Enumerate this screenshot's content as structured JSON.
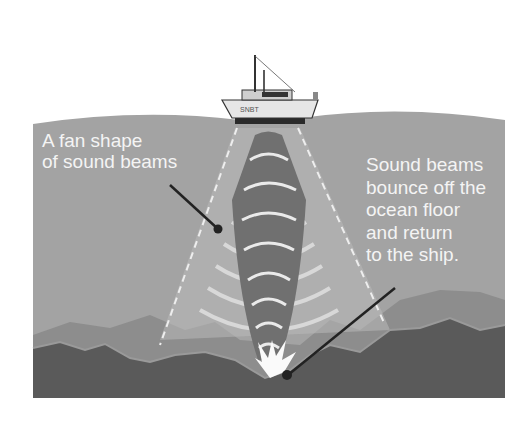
{
  "diagram": {
    "labels": {
      "fan_shape": "A fan shape\nof sound beams",
      "bounce": "Sound beams\nbounce off the\nocean floor\nand return\nto the ship."
    },
    "ship_name": "SNBT",
    "colors": {
      "sky": "#ffffff",
      "water": "#a3a3a3",
      "seafloor_dark": "#5a5a5a",
      "seafloor_light": "#8a8a8a",
      "beam_center": "#6e6e6e",
      "beam_arcs": "#cfcfcf",
      "pointer": "#222222"
    }
  }
}
